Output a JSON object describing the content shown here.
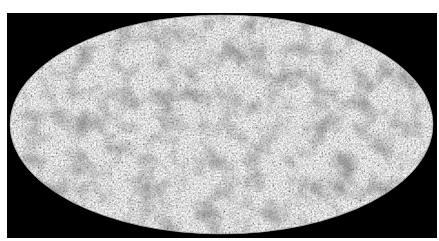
{
  "image": {
    "subject": "all-sky map",
    "projection": "Mollweide (elliptical)",
    "colormap": "grayscale",
    "colors": {
      "page_background": "#ffffff",
      "frame_background": "#000000",
      "map_mean": "#bdbdbd",
      "map_dark": "#3a3a3a",
      "map_light": "#e6e6e6"
    },
    "ellipse": {
      "cx": 221.5,
      "cy": 124.5,
      "rx": 211.5,
      "ry": 109.5
    }
  }
}
